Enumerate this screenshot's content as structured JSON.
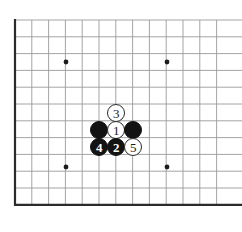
{
  "figure": {
    "kind": "go-board-diagram",
    "width": 242,
    "height": 232,
    "background_color": "#ffffff"
  },
  "board": {
    "origin_x": 15,
    "origin_y": 20,
    "cell_size": 16.8,
    "columns": 13,
    "rows": 12,
    "line_color": "#9a9a9a",
    "line_width": 0.9,
    "edge_color": "#2b2b2b",
    "edge_width": 2.2,
    "edges": [
      "left",
      "bottom"
    ],
    "star_point_color": "#1c1c1c",
    "star_point_radius": 2.4,
    "star_points": [
      {
        "name": "star-point-top-left",
        "x": 66,
        "y": 62
      },
      {
        "name": "star-point-top-right",
        "x": 167,
        "y": 62
      },
      {
        "name": "star-point-bottom-left",
        "x": 66,
        "y": 167
      },
      {
        "name": "star-point-bottom-right",
        "x": 167,
        "y": 167
      }
    ]
  },
  "stones": [
    {
      "id": "stone-white-3",
      "color": "white",
      "label": "3",
      "move_number": 3,
      "x": 116,
      "y": 113,
      "diameter": 18
    },
    {
      "id": "stone-black-left",
      "color": "black",
      "label": "",
      "move_number": null,
      "x": 99,
      "y": 130,
      "diameter": 18
    },
    {
      "id": "stone-white-1",
      "color": "white",
      "label": "1",
      "move_number": 1,
      "x": 116,
      "y": 130,
      "diameter": 18
    },
    {
      "id": "stone-black-right",
      "color": "black",
      "label": "",
      "move_number": null,
      "x": 133,
      "y": 130,
      "diameter": 18
    },
    {
      "id": "stone-black-4",
      "color": "black",
      "label": "4",
      "move_number": 4,
      "x": 99,
      "y": 147,
      "diameter": 18
    },
    {
      "id": "stone-black-2",
      "color": "black",
      "label": "2",
      "move_number": 2,
      "x": 116,
      "y": 147,
      "diameter": 18
    },
    {
      "id": "stone-white-5",
      "color": "white",
      "label": "5",
      "move_number": 5,
      "x": 133,
      "y": 147,
      "diameter": 18
    }
  ]
}
